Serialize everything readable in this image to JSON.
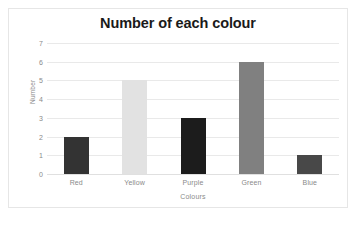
{
  "chart_data": {
    "type": "bar",
    "title": "Number of each colour",
    "xlabel": "Colours",
    "ylabel": "Number",
    "categories": [
      "Red",
      "Yellow",
      "Purple",
      "Green",
      "Blue"
    ],
    "values": [
      2,
      5,
      3,
      6,
      1
    ],
    "bar_colors": [
      "#333333",
      "#e2e2e2",
      "#1c1c1c",
      "#808080",
      "#484848"
    ],
    "ylim": [
      0,
      7
    ],
    "yticks": [
      0,
      1,
      2,
      3,
      4,
      5,
      6,
      7
    ],
    "ytick_labels": [
      "0",
      "1",
      "2",
      "3",
      "4",
      "5",
      "6",
      "7"
    ],
    "grid": true,
    "grid_axis": "y",
    "legend": false,
    "background": "#ffffff",
    "border_color": "#e6e6e6",
    "gridline_color": "#e9e9e9",
    "tick_label_color": "#8a8a8a",
    "title_color": "#1a1a1a"
  }
}
